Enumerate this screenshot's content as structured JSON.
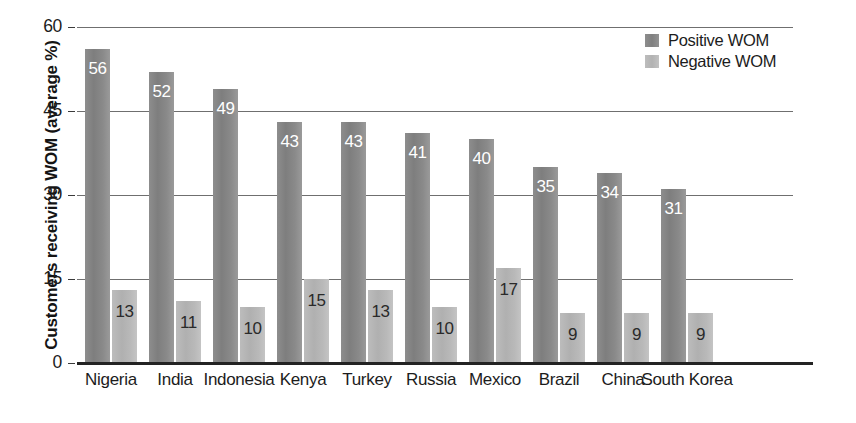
{
  "chart_data": {
    "type": "bar",
    "title": "",
    "subtitle": "",
    "xlabel": "",
    "ylabel": "Customers receiving WOM (average %)",
    "ylim": [
      0,
      60
    ],
    "yticks": [
      0,
      15,
      30,
      45,
      60
    ],
    "ytick_labels": [
      "0",
      "15",
      "30",
      "45",
      "60"
    ],
    "grid": true,
    "grid_axis": "y",
    "legend_position": "top-right",
    "categories": [
      "Nigeria",
      "India",
      "Indonesia",
      "Kenya",
      "Turkey",
      "Russia",
      "Mexico",
      "Brazil",
      "China",
      "South Korea"
    ],
    "series": [
      {
        "name": "Positive WOM",
        "color": "#878787",
        "label_color": "#ffffff",
        "values": [
          56,
          52,
          49,
          43,
          43,
          41,
          40,
          35,
          34,
          31
        ]
      },
      {
        "name": "Negative WOM",
        "color": "#b5b5b5",
        "label_color": "#2a2a2a",
        "values": [
          13,
          11,
          10,
          15,
          13,
          10,
          17,
          9,
          9,
          9
        ]
      }
    ]
  },
  "legend": {
    "items": [
      {
        "label": "Positive WOM",
        "swatch": "positive"
      },
      {
        "label": "Negative WOM",
        "swatch": "negative"
      }
    ]
  },
  "colors": {
    "positive_bar": "#878787",
    "negative_bar": "#b5b5b5",
    "gridline": "#6f6f6f",
    "axis": "#232323",
    "text": "#1c1c1c",
    "background": "#ffffff"
  }
}
